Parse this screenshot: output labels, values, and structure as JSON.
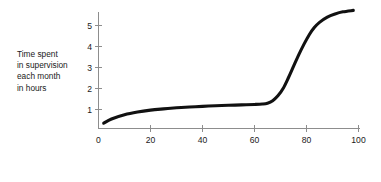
{
  "figure": {
    "background_color": "#ffffff",
    "curve_color": "#111111",
    "axis_color": "#8d8d8d",
    "text_color": "#1a1a1a"
  },
  "y_caption": {
    "line1": "Time spent",
    "line2": "in supervision",
    "line3": "each month",
    "line4": "in hours"
  },
  "x_caption": {
    "line1": "Degree of job satisfaction as",
    "line2": "measured on x scale"
  },
  "chart_data": {
    "type": "line",
    "title": "",
    "subtitle": "",
    "xlabel": "Degree of job satisfaction as measured on x scale",
    "ylabel": "Time spent in supervision each month in hours",
    "xlim": [
      0,
      100
    ],
    "ylim": [
      0,
      5.9
    ],
    "grid": false,
    "legend": "none",
    "xticks": [
      0,
      20,
      40,
      60,
      80,
      100
    ],
    "xtick_labels": [
      "0",
      "20",
      "40",
      "60",
      "80",
      "100"
    ],
    "yticks": [
      1,
      2,
      3,
      4,
      5
    ],
    "ytick_labels": [
      "1",
      "2",
      "3",
      "4",
      "5"
    ],
    "annotations": [],
    "series": [
      {
        "name": "Supervision time",
        "x": [
          2,
          5,
          10,
          15,
          20,
          25,
          30,
          35,
          40,
          45,
          50,
          55,
          60,
          63,
          65,
          67,
          69,
          71,
          73,
          75,
          77,
          79,
          81,
          83,
          85,
          88,
          91,
          94,
          98
        ],
        "y": [
          0.35,
          0.55,
          0.75,
          0.88,
          0.97,
          1.03,
          1.08,
          1.12,
          1.15,
          1.18,
          1.2,
          1.22,
          1.24,
          1.26,
          1.3,
          1.42,
          1.65,
          2.0,
          2.5,
          3.05,
          3.6,
          4.1,
          4.55,
          4.9,
          5.15,
          5.4,
          5.55,
          5.65,
          5.72
        ]
      }
    ]
  }
}
